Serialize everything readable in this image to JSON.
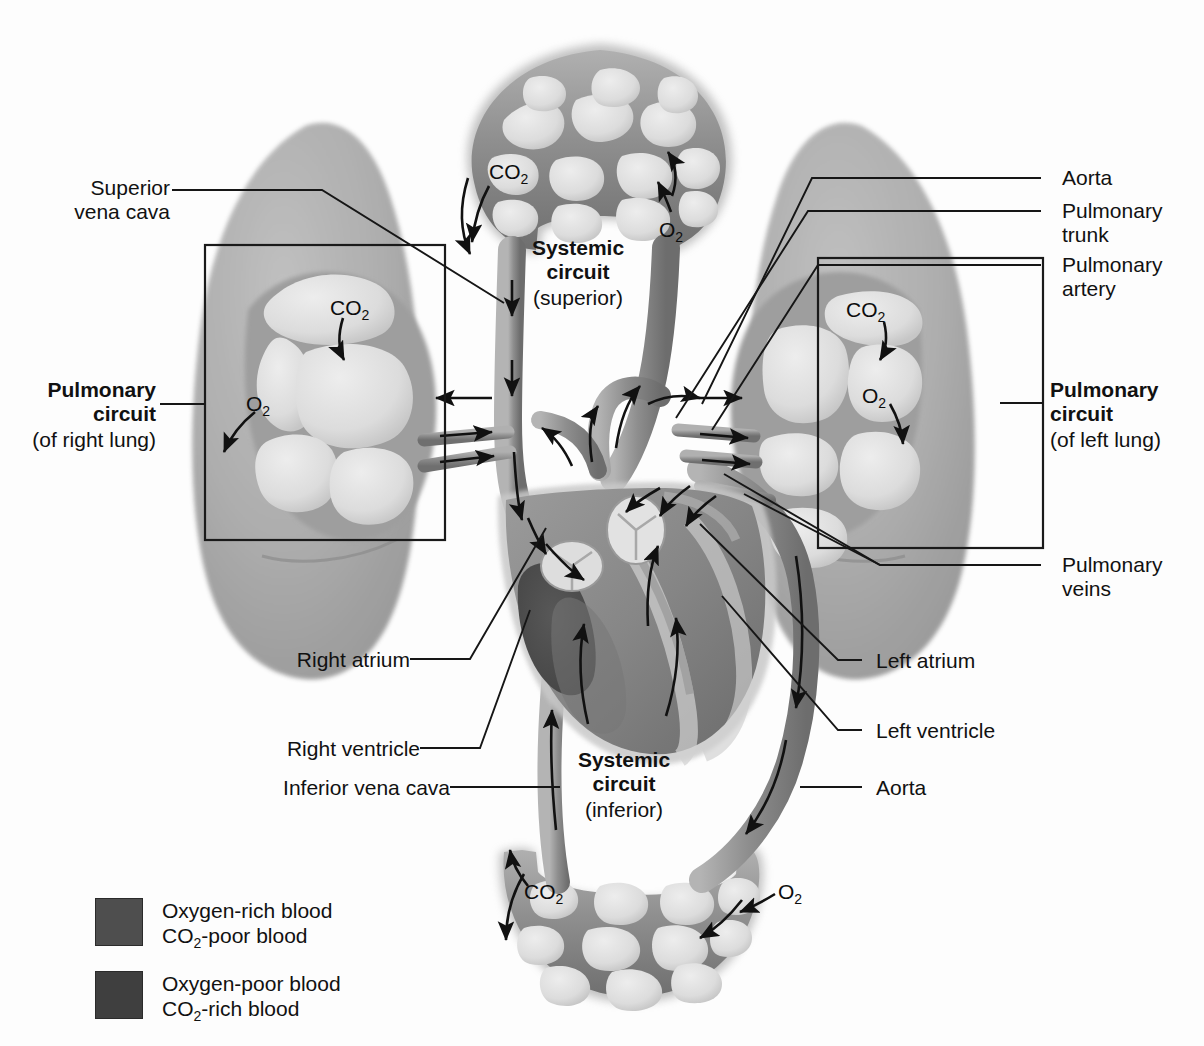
{
  "figure": {
    "background": "#ffffff"
  },
  "labels": {
    "superior_vena_cava": "Superior\nvena cava",
    "pulmonary_circuit_right_bold": "Pulmonary\ncircuit",
    "pulmonary_circuit_right_paren": "(of right lung)",
    "pulmonary_circuit_left_bold": "Pulmonary\ncircuit",
    "pulmonary_circuit_left_paren": "(of left lung)",
    "systemic_circuit_superior_bold": "Systemic\ncircuit",
    "systemic_circuit_superior_paren": "(superior)",
    "systemic_circuit_inferior_bold": "Systemic\ncircuit",
    "systemic_circuit_inferior_paren": "(inferior)",
    "aorta_top": "Aorta",
    "pulmonary_trunk": "Pulmonary\ntrunk",
    "pulmonary_artery": "Pulmonary\nartery",
    "pulmonary_veins": "Pulmonary\nveins",
    "right_atrium": "Right atrium",
    "right_ventricle": "Right ventricle",
    "inferior_vena_cava": "Inferior vena cava",
    "left_atrium": "Left atrium",
    "left_ventricle": "Left ventricle",
    "aorta_bottom": "Aorta"
  },
  "gas_labels": {
    "systemic_top_co2": "CO2",
    "systemic_top_o2": "O2",
    "right_lung_co2": "CO2",
    "right_lung_o2": "O2",
    "left_lung_co2": "CO2",
    "left_lung_o2": "O2",
    "systemic_bottom_co2": "CO2",
    "systemic_bottom_o2": "O2"
  },
  "legend": {
    "items": [
      {
        "swatch_color": "#4e4e4e",
        "line1": "Oxygen-rich blood",
        "line2_prefix": "CO",
        "line2_sub": "2",
        "line2_suffix": "-poor blood"
      },
      {
        "swatch_color": "#3f3f3f",
        "line1": "Oxygen-poor blood",
        "line2_prefix": "CO",
        "line2_sub": "2",
        "line2_suffix": "-rich blood"
      }
    ]
  },
  "colors": {
    "oxygen_rich": "#4e4e4e",
    "oxygen_poor": "#3f3f3f",
    "lung_tissue": "#a8a8a8",
    "vessel_mid": "#9a9a9a",
    "vessel_dark": "#7d7d7d",
    "alveolus_light": "#d8d8d8",
    "leader_line": "#161616",
    "text": "#111111"
  }
}
